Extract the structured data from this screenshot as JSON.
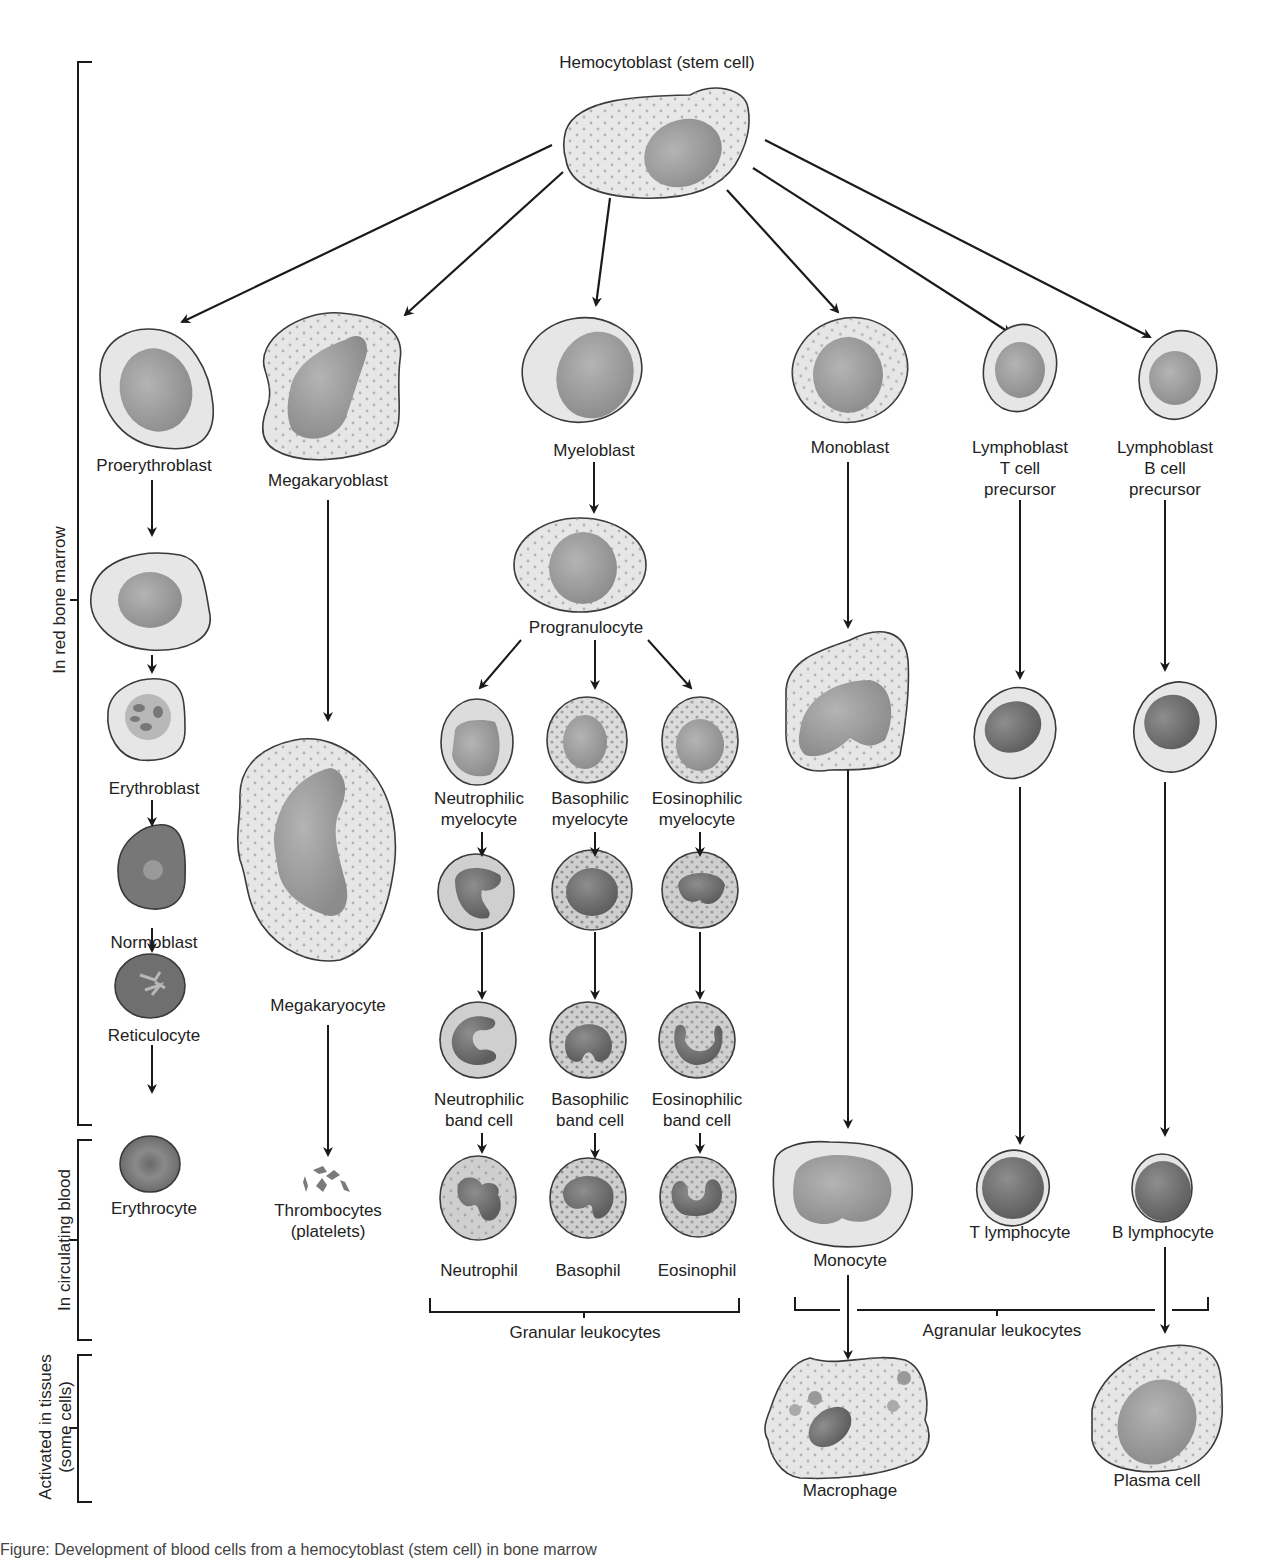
{
  "title": "Hemocytoblast (stem cell)",
  "colors": {
    "cell_fill": "#e6e6e6",
    "cell_stroke": "#3a3a3a",
    "nucleus_light": "#a8a8a8",
    "nucleus_dark": "#6e6e6e",
    "granule": "#8a8a8a",
    "line": "#1a1a1a"
  },
  "side_brackets": [
    {
      "label": "In red bone marrow",
      "y1": 62,
      "y2": 1125
    },
    {
      "label": "In circulating blood",
      "y1": 1140,
      "y2": 1340
    },
    {
      "label": "Activated in tissues\n(some cells)",
      "y1": 1355,
      "y2": 1502
    }
  ],
  "lineages": {
    "erythrocyte": [
      "Proerythroblast",
      "Erythroblast",
      "Normoblast",
      "Reticulocyte",
      "Erythrocyte"
    ],
    "platelet": [
      "Megakaryoblast",
      "Megakaryocyte",
      "Thrombocytes\n(platelets)"
    ],
    "granulocyte_common": [
      "Myeloblast",
      "Progranulocyte"
    ],
    "neutrophil": [
      "Neutrophilic\nmyelocyte",
      "Neutrophilic\nband cell",
      "Neutrophil"
    ],
    "basophil": [
      "Basophilic\nmyelocyte",
      "Basophilic\nband cell",
      "Basophil"
    ],
    "eosinophil": [
      "Eosinophilic\nmyelocyte",
      "Eosinophilic\nband cell",
      "Eosinophil"
    ],
    "monocyte": [
      "Monoblast",
      "Monocyte",
      "Macrophage"
    ],
    "t_lymphocyte": [
      "Lymphoblast\nT cell\nprecursor",
      "T lymphocyte"
    ],
    "b_lymphocyte": [
      "Lymphoblast\nB cell\nprecursor",
      "B lymphocyte",
      "Plasma cell"
    ]
  },
  "groups": {
    "granular": "Granular leukocytes",
    "agranular": "Agranular leukocytes"
  },
  "caption": "Figure: Development of blood cells from a hemocytoblast (stem cell) in bone marrow"
}
